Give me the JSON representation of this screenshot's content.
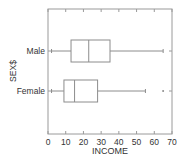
{
  "chart_data": {
    "type": "boxplot",
    "orientation": "horizontal",
    "title": "",
    "xlabel": "INCOME",
    "ylabel": "SEX$",
    "xlim": [
      0,
      70
    ],
    "xticks": [
      0,
      10,
      20,
      30,
      40,
      50,
      60,
      70
    ],
    "grid": false,
    "legend": null,
    "categories": [
      "Male",
      "Female"
    ],
    "series": [
      {
        "name": "Male",
        "whisker_low": 2,
        "q1": 13,
        "median": 23,
        "q3": 35,
        "whisker_high": 65,
        "outliers": []
      },
      {
        "name": "Female",
        "whisker_low": 2,
        "q1": 9,
        "median": 15,
        "q3": 28,
        "whisker_high": 55,
        "outliers": [
          65
        ]
      }
    ]
  },
  "colors": {
    "frame": "#9a9a9a",
    "box": "#8c8c8c",
    "text": "#333333",
    "background": "#ffffff"
  }
}
